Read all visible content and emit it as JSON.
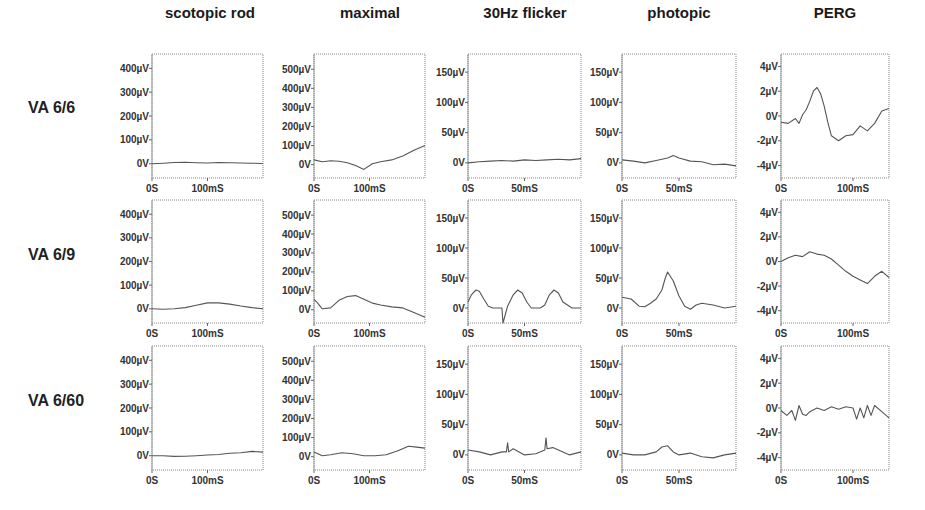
{
  "figure": {
    "columns": [
      "scotopic rod",
      "maximal",
      "30Hz flicker",
      "photopic",
      "PERG"
    ],
    "rows": [
      "VA 6/6",
      "VA 6/9",
      "VA 6/60"
    ]
  },
  "chart_data": {
    "type": "line",
    "title": "",
    "columns": [
      {
        "name": "scotopic rod",
        "ylim": [
          -60,
          460
        ],
        "yticks": [
          "0V",
          "100µV",
          "200µV",
          "300µV",
          "400µV"
        ],
        "ytick_values": [
          0,
          100,
          200,
          300,
          400
        ],
        "xlim": [
          0,
          200
        ],
        "xticks": [
          "0S",
          "100mS"
        ],
        "xtick_values": [
          0,
          100
        ]
      },
      {
        "name": "maximal",
        "ylim": [
          -70,
          580
        ],
        "yticks": [
          "0V",
          "100µV",
          "200µV",
          "300µV",
          "400µV",
          "500µV"
        ],
        "ytick_values": [
          0,
          100,
          200,
          300,
          400,
          500
        ],
        "xlim": [
          0,
          200
        ],
        "xticks": [
          "0S",
          "100mS"
        ],
        "xtick_values": [
          0,
          100
        ]
      },
      {
        "name": "30Hz flicker",
        "ylim": [
          -25,
          180
        ],
        "yticks": [
          "0V",
          "50µV",
          "100µV",
          "150µV"
        ],
        "ytick_values": [
          0,
          50,
          100,
          150
        ],
        "xlim": [
          0,
          100
        ],
        "xticks": [
          "0S",
          "50mS"
        ],
        "xtick_values": [
          0,
          50
        ]
      },
      {
        "name": "photopic",
        "ylim": [
          -25,
          180
        ],
        "yticks": [
          "0V",
          "50µV",
          "100µV",
          "150µV"
        ],
        "ytick_values": [
          0,
          50,
          100,
          150
        ],
        "xlim": [
          0,
          100
        ],
        "xticks": [
          "0S",
          "50mS"
        ],
        "xtick_values": [
          0,
          50
        ]
      },
      {
        "name": "PERG",
        "ylim": [
          -5,
          5
        ],
        "yticks": [
          "-4µV",
          "-2µV",
          "0V",
          "2µV",
          "4µV"
        ],
        "ytick_values": [
          -4,
          -2,
          0,
          2,
          4
        ],
        "xlim": [
          0,
          150
        ],
        "xticks": [
          "0S",
          "100mS"
        ],
        "xtick_values": [
          0,
          100
        ]
      }
    ],
    "series": [
      {
        "row": "VA 6/6",
        "col": "scotopic rod",
        "x": [
          0,
          20,
          40,
          60,
          80,
          100,
          120,
          140,
          160,
          180,
          200
        ],
        "y": [
          0,
          2,
          5,
          6,
          4,
          3,
          5,
          4,
          3,
          2,
          1
        ]
      },
      {
        "row": "VA 6/6",
        "col": "maximal",
        "x": [
          0,
          15,
          30,
          45,
          60,
          75,
          90,
          105,
          120,
          140,
          160,
          180,
          200
        ],
        "y": [
          25,
          15,
          20,
          18,
          10,
          -5,
          -25,
          5,
          15,
          25,
          45,
          75,
          100
        ]
      },
      {
        "row": "VA 6/6",
        "col": "30Hz flicker",
        "x": [
          0,
          10,
          20,
          30,
          40,
          50,
          60,
          70,
          80,
          90,
          100
        ],
        "y": [
          0,
          2,
          3,
          4,
          3,
          5,
          4,
          5,
          6,
          5,
          7
        ]
      },
      {
        "row": "VA 6/6",
        "col": "photopic",
        "x": [
          0,
          10,
          20,
          30,
          40,
          45,
          50,
          60,
          70,
          80,
          90,
          100
        ],
        "y": [
          5,
          3,
          0,
          4,
          8,
          12,
          8,
          3,
          2,
          -3,
          -2,
          -5
        ]
      },
      {
        "row": "VA 6/6",
        "col": "PERG",
        "x": [
          0,
          10,
          20,
          25,
          30,
          35,
          40,
          45,
          50,
          55,
          60,
          65,
          70,
          80,
          90,
          100,
          110,
          120,
          130,
          140,
          150
        ],
        "y": [
          -0.5,
          -0.6,
          -0.2,
          -0.6,
          0.1,
          0.5,
          1.2,
          2.0,
          2.3,
          1.8,
          0.8,
          -0.5,
          -1.6,
          -2.0,
          -1.6,
          -1.5,
          -0.8,
          -1.2,
          -0.6,
          0.4,
          0.6
        ]
      },
      {
        "row": "VA 6/9",
        "col": "scotopic rod",
        "x": [
          0,
          20,
          40,
          60,
          80,
          100,
          120,
          140,
          160,
          180,
          200
        ],
        "y": [
          0,
          -2,
          0,
          5,
          15,
          25,
          25,
          20,
          12,
          5,
          0
        ]
      },
      {
        "row": "VA 6/9",
        "col": "maximal",
        "x": [
          0,
          5,
          15,
          30,
          45,
          60,
          75,
          90,
          105,
          120,
          140,
          160,
          180,
          200
        ],
        "y": [
          55,
          40,
          5,
          10,
          50,
          70,
          75,
          55,
          35,
          25,
          15,
          10,
          -15,
          -40
        ]
      },
      {
        "row": "VA 6/9",
        "col": "30Hz flicker",
        "x": [
          0,
          3,
          7,
          10,
          14,
          18,
          22,
          30,
          31,
          35,
          40,
          44,
          48,
          52,
          56,
          64,
          68,
          72,
          76,
          80,
          84,
          92,
          100
        ],
        "y": [
          10,
          22,
          30,
          28,
          15,
          3,
          0,
          0,
          -25,
          3,
          22,
          30,
          25,
          10,
          0,
          0,
          5,
          22,
          30,
          25,
          10,
          0,
          0
        ]
      },
      {
        "row": "VA 6/9",
        "col": "photopic",
        "x": [
          0,
          8,
          15,
          20,
          25,
          30,
          35,
          38,
          40,
          45,
          50,
          55,
          60,
          65,
          70,
          80,
          90,
          100
        ],
        "y": [
          18,
          15,
          3,
          2,
          8,
          15,
          30,
          50,
          60,
          45,
          20,
          3,
          -2,
          5,
          8,
          5,
          0,
          3
        ]
      },
      {
        "row": "VA 6/9",
        "col": "PERG",
        "x": [
          0,
          10,
          20,
          30,
          40,
          50,
          60,
          70,
          80,
          90,
          100,
          110,
          120,
          130,
          140,
          150
        ],
        "y": [
          0,
          0.3,
          0.5,
          0.4,
          0.8,
          0.6,
          0.5,
          0.2,
          -0.3,
          -0.8,
          -1.2,
          -1.5,
          -1.8,
          -1.2,
          -0.8,
          -1.3
        ]
      },
      {
        "row": "VA 6/60",
        "col": "scotopic rod",
        "x": [
          0,
          20,
          40,
          60,
          80,
          100,
          120,
          140,
          160,
          180,
          200
        ],
        "y": [
          0,
          0,
          -3,
          -2,
          0,
          3,
          5,
          10,
          12,
          18,
          15
        ]
      },
      {
        "row": "VA 6/60",
        "col": "maximal",
        "x": [
          0,
          15,
          30,
          50,
          70,
          90,
          110,
          130,
          150,
          170,
          185,
          200
        ],
        "y": [
          25,
          5,
          10,
          20,
          15,
          5,
          5,
          10,
          30,
          55,
          50,
          45
        ]
      },
      {
        "row": "VA 6/60",
        "col": "30Hz flicker",
        "x": [
          0,
          10,
          20,
          30,
          34,
          35,
          36,
          40,
          50,
          60,
          68,
          69,
          70,
          75,
          80,
          90,
          100
        ],
        "y": [
          8,
          5,
          0,
          5,
          5,
          20,
          5,
          10,
          0,
          2,
          8,
          28,
          10,
          12,
          8,
          0,
          5
        ]
      },
      {
        "row": "VA 6/60",
        "col": "photopic",
        "x": [
          0,
          10,
          20,
          30,
          35,
          40,
          45,
          50,
          60,
          70,
          80,
          90,
          100
        ],
        "y": [
          3,
          0,
          0,
          5,
          13,
          15,
          5,
          0,
          3,
          -3,
          -5,
          0,
          3
        ]
      },
      {
        "row": "VA 6/60",
        "col": "PERG",
        "x": [
          0,
          8,
          15,
          20,
          25,
          30,
          35,
          40,
          50,
          60,
          70,
          80,
          90,
          100,
          105,
          110,
          115,
          120,
          125,
          130,
          140,
          150
        ],
        "y": [
          -0.2,
          -0.6,
          -0.2,
          -1.0,
          0.2,
          -0.5,
          -0.6,
          -0.3,
          0,
          -0.2,
          0.1,
          -0.1,
          0.1,
          0,
          -0.9,
          0,
          -0.8,
          0.2,
          -0.6,
          0.2,
          -0.3,
          -0.8
        ]
      }
    ]
  }
}
